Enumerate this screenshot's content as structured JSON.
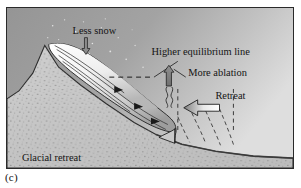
{
  "figure": {
    "caption": "(c)",
    "scene_title": "Glacial retreat",
    "labels": {
      "less_snow": "Less snow",
      "higher_equilibrium_line": "Higher equilibrium line",
      "more_ablation": "More ablation",
      "retreat": "Retreat",
      "glacial_retreat": "Glacial retreat"
    },
    "icons": {
      "snowfall_arrow": "down-arrow-icon",
      "ablation_arrow": "up-wavy-arrow-icon",
      "retreat_arrow": "left-block-arrow-icon",
      "flow_arrow": "flow-arrowhead-icon",
      "equilibrium_line": "dashed-horizontal-line-icon",
      "former_terminus_line": "dashed-vertical-line-icon",
      "former_positions": "dashed-curve-icon"
    },
    "colors": {
      "sky": "#9e9e9e",
      "sky_light": "#d2d2d2",
      "ground": "#c6c6c6",
      "ground_dark": "#b0b0b0",
      "glacier_light": "#fdfdfd",
      "glacier_shadow": "#9a9a9a",
      "outline": "#1d1d1d",
      "text": "#141414",
      "frame": "#2a2a2a"
    },
    "label_positions": {
      "less_snow": {
        "x": 88,
        "y": 26
      },
      "higher_equilibrium_line": {
        "x": 195,
        "y": 48
      },
      "more_ablation": {
        "x": 212,
        "y": 69
      },
      "retreat": {
        "x": 225,
        "y": 92
      },
      "glacial_retreat": {
        "x": 48,
        "y": 155
      }
    }
  }
}
